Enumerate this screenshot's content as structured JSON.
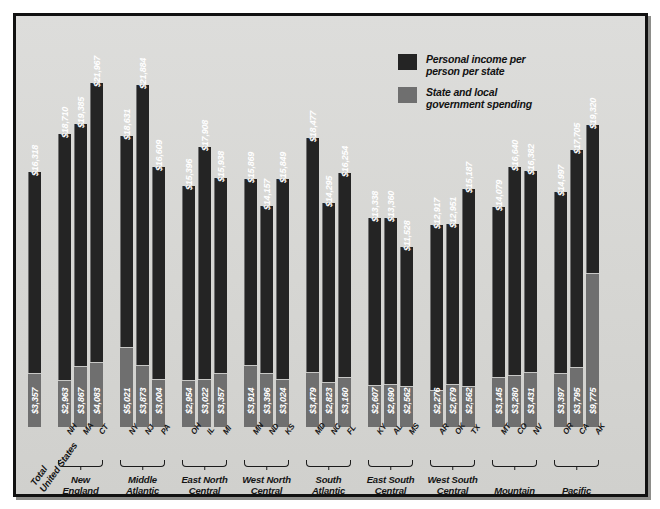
{
  "chart_data": {
    "type": "bar",
    "title": "",
    "subtitle": "",
    "xlabel": "",
    "ylabel": "",
    "grid": false,
    "legend_position": "top-right",
    "ylim": [
      0,
      22500
    ],
    "legend": [
      {
        "key": "income",
        "label": "Personal income per\nperson per state",
        "color": "#242424"
      },
      {
        "key": "gov",
        "label": "State and local\ngovernment spending",
        "color": "#6f6f6f"
      }
    ],
    "series": [
      {
        "name": "Personal income per person per state",
        "key": "income",
        "color": "#242424"
      },
      {
        "name": "State and local government spending",
        "key": "gov",
        "color": "#6f6f6f"
      }
    ],
    "groups": [
      {
        "region": "Total\nUnited States",
        "is_total": true,
        "bars": [
          {
            "state": "",
            "income": 16318,
            "gov": 3357,
            "income_label": "$16,318",
            "gov_label": "$3,357"
          }
        ]
      },
      {
        "region": "New\nEngland",
        "is_total": false,
        "bars": [
          {
            "state": "NH",
            "income": 18710,
            "gov": 2963,
            "income_label": "$18,710",
            "gov_label": "$2,963"
          },
          {
            "state": "MA",
            "income": 19385,
            "gov": 3867,
            "income_label": "$19,385",
            "gov_label": "$3,867"
          },
          {
            "state": "CT",
            "income": 21967,
            "gov": 4083,
            "income_label": "$21,967",
            "gov_label": "$4,083"
          }
        ]
      },
      {
        "region": "Middle\nAtlantic",
        "is_total": false,
        "bars": [
          {
            "state": "NY",
            "income": 18631,
            "gov": 5021,
            "income_label": "$18,631",
            "gov_label": "$5,021"
          },
          {
            "state": "NJ",
            "income": 21884,
            "gov": 3873,
            "income_label": "$21,884",
            "gov_label": "$3,873"
          },
          {
            "state": "PA",
            "income": 16609,
            "gov": 3004,
            "income_label": "$16,609",
            "gov_label": "$3,004"
          }
        ]
      },
      {
        "region": "East North\nCentral",
        "is_total": false,
        "bars": [
          {
            "state": "OH",
            "income": 15396,
            "gov": 2954,
            "income_label": "$15,396",
            "gov_label": "$2,954"
          },
          {
            "state": "IL",
            "income": 17908,
            "gov": 3022,
            "income_label": "$17,908",
            "gov_label": "$3,022"
          },
          {
            "state": "MI",
            "income": 15938,
            "gov": 3357,
            "income_label": "$15,938",
            "gov_label": "$3,357"
          }
        ]
      },
      {
        "region": "West North\nCentral",
        "is_total": false,
        "bars": [
          {
            "state": "MN",
            "income": 15869,
            "gov": 3914,
            "income_label": "$15,869",
            "gov_label": "$3,914"
          },
          {
            "state": "ND",
            "income": 14157,
            "gov": 3396,
            "income_label": "$14,157",
            "gov_label": "$3,396"
          },
          {
            "state": "KS",
            "income": 15849,
            "gov": 3024,
            "income_label": "$15,849",
            "gov_label": "$3,024"
          }
        ]
      },
      {
        "region": "South\nAtlantic",
        "is_total": false,
        "bars": [
          {
            "state": "MD",
            "income": 18477,
            "gov": 3479,
            "income_label": "$18,477",
            "gov_label": "$3,479"
          },
          {
            "state": "NC",
            "income": 14295,
            "gov": 2823,
            "income_label": "$14,295",
            "gov_label": "$2,823"
          },
          {
            "state": "FL",
            "income": 16254,
            "gov": 3160,
            "income_label": "$16,254",
            "gov_label": "$3,160"
          }
        ]
      },
      {
        "region": "East South\nCentral",
        "is_total": false,
        "bars": [
          {
            "state": "KY",
            "income": 13338,
            "gov": 2607,
            "income_label": "$13,338",
            "gov_label": "$2,607"
          },
          {
            "state": "AL",
            "income": 13360,
            "gov": 2690,
            "income_label": "$13,360",
            "gov_label": "$2,690"
          },
          {
            "state": "MS",
            "income": 11528,
            "gov": 2562,
            "income_label": "$11,528",
            "gov_label": "$2,562"
          }
        ]
      },
      {
        "region": "West South\nCentral",
        "is_total": false,
        "bars": [
          {
            "state": "AR",
            "income": 12917,
            "gov": 2276,
            "income_label": "$12,917",
            "gov_label": "$2,276"
          },
          {
            "state": "OK",
            "income": 12951,
            "gov": 2679,
            "income_label": "$12,951",
            "gov_label": "$2,679"
          },
          {
            "state": "TX",
            "income": 15187,
            "gov": 2562,
            "income_label": "$15,187",
            "gov_label": "$2,562"
          }
        ]
      },
      {
        "region": "Mountain",
        "is_total": false,
        "bars": [
          {
            "state": "MT",
            "income": 14079,
            "gov": 3145,
            "income_label": "$14,079",
            "gov_label": "$3,145"
          },
          {
            "state": "CO",
            "income": 16640,
            "gov": 3280,
            "income_label": "$16,640",
            "gov_label": "$3,280"
          },
          {
            "state": "NV",
            "income": 16382,
            "gov": 3431,
            "income_label": "$16,382",
            "gov_label": "$3,431"
          }
        ]
      },
      {
        "region": "Pacific",
        "is_total": false,
        "bars": [
          {
            "state": "OR",
            "income": 14997,
            "gov": 3397,
            "income_label": "$14,997",
            "gov_label": "$3,397"
          },
          {
            "state": "CA",
            "income": 17705,
            "gov": 3795,
            "income_label": "$17,705",
            "gov_label": "$3,795"
          },
          {
            "state": "AK",
            "income": 19320,
            "gov": 9775,
            "income_label": "$19,320",
            "gov_label": "$9,775"
          }
        ]
      }
    ]
  }
}
